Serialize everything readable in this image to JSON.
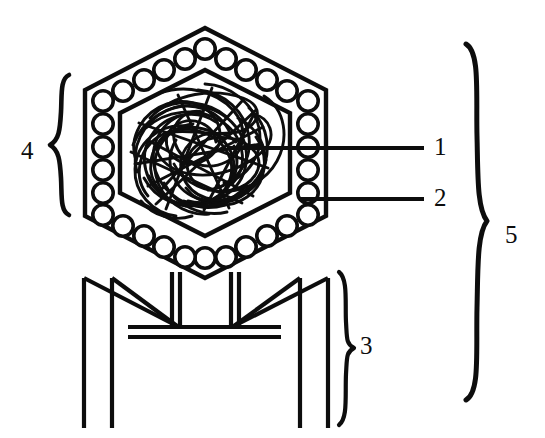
{
  "figure": {
    "type": "labeled-line-diagram",
    "background_color": "#ffffff",
    "stroke_color": "#0d0d0d",
    "width": 545,
    "height": 438
  },
  "labels": {
    "one": "1",
    "two": "2",
    "three": "3",
    "four": "4",
    "five": "5"
  },
  "callouts": [
    {
      "label": "1",
      "target": "nucleic-acid-genome",
      "leader": "horizontal-line",
      "from_x": 228,
      "to_x": 424,
      "y": 148
    },
    {
      "label": "2",
      "target": "capsomere-protein-subunit",
      "leader": "horizontal-line",
      "from_x": 300,
      "to_x": 424,
      "y": 199
    }
  ],
  "brackets": [
    {
      "label": "4",
      "side": "left",
      "target": "head-capsid",
      "top": 75,
      "bottom": 215
    },
    {
      "label": "3",
      "side": "right",
      "target": "tail-assembly",
      "top": 272,
      "bottom": 425
    },
    {
      "label": "5",
      "side": "right",
      "target": "whole-virion",
      "top": 44,
      "bottom": 400
    }
  ],
  "parts": {
    "head": {
      "shape": "hexagon",
      "outer_vertices": "205,28 326,90 326,216 205,278 85,216 85,90",
      "inner_vertices": "205,70 290,113 290,193 205,236 120,193 120,113",
      "capsomere_count": 30,
      "capsomere_radius": 10
    },
    "genome": {
      "shape": "tangled-strand",
      "location": "inside-capsid"
    },
    "tail": {
      "sheath": "double-vertical-lines",
      "baseplate": "double-horizontal-line",
      "fiber_count": 4
    }
  }
}
